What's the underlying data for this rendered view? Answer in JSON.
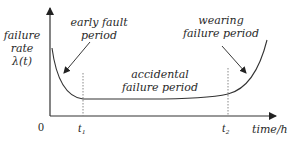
{
  "diagram": {
    "y_axis_label": [
      "failure",
      "rate",
      "λ(t)"
    ],
    "x_axis_label": "time/h",
    "origin_label": "0",
    "t1_label": "t₁",
    "t2_label": "t₂",
    "regions": [
      {
        "name": "early-fault",
        "label_lines": [
          "early fault",
          "period"
        ]
      },
      {
        "name": "accidental-failure",
        "label_lines": [
          "accidental",
          "failure period"
        ]
      },
      {
        "name": "wearing-failure",
        "label_lines": [
          "wearing",
          "failure period"
        ]
      }
    ],
    "colors": {
      "line": "#333333",
      "text": "#2a2a2a",
      "dashed": "#888888"
    }
  }
}
